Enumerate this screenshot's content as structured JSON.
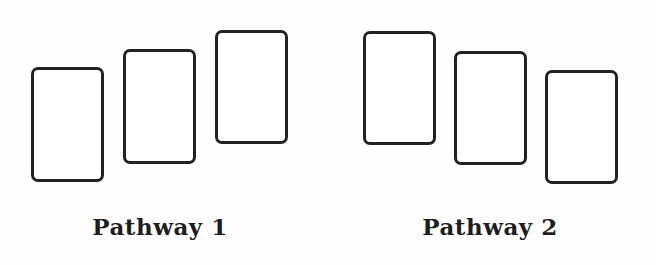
{
  "diagram": {
    "stroke_color": "#222222",
    "background": "#ffffff",
    "groups": [
      {
        "label": "Pathway 1",
        "trend": "ascending",
        "cards": [
          {
            "x": 31,
            "y": 67,
            "w": 73,
            "h": 115
          },
          {
            "x": 123,
            "y": 49,
            "w": 73,
            "h": 115
          },
          {
            "x": 215,
            "y": 30,
            "w": 73,
            "h": 114
          }
        ]
      },
      {
        "label": "Pathway 2",
        "trend": "descending",
        "cards": [
          {
            "x": 363,
            "y": 31,
            "w": 73,
            "h": 114
          },
          {
            "x": 454,
            "y": 51,
            "w": 73,
            "h": 114
          },
          {
            "x": 545,
            "y": 70,
            "w": 73,
            "h": 114
          }
        ]
      }
    ]
  }
}
